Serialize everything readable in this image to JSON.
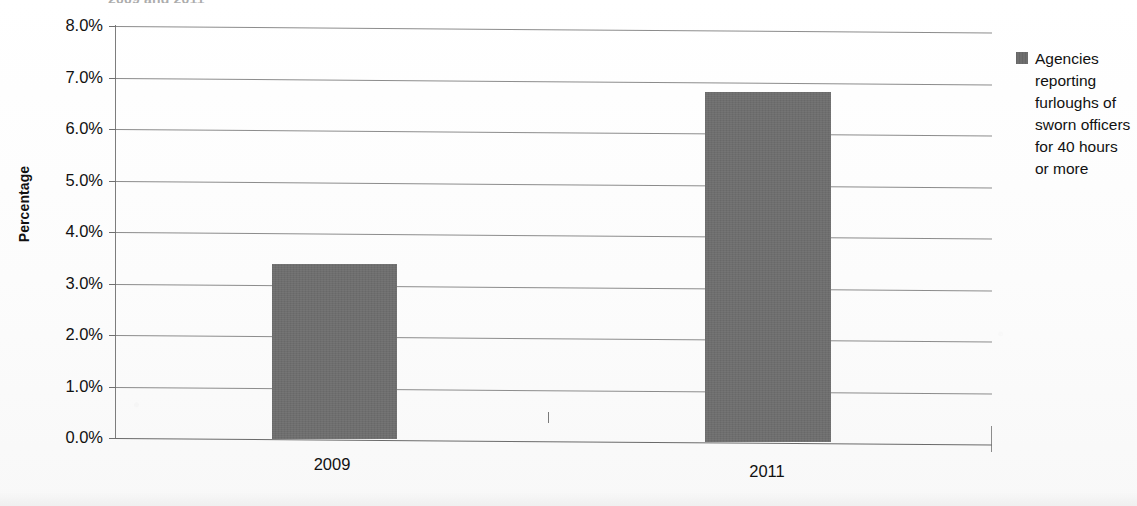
{
  "chart_data": {
    "type": "bar",
    "title": "2009 and 2011",
    "title_visible_note": "cropped at top edge",
    "xlabel": "",
    "ylabel": "Percentage",
    "categories": [
      "2009",
      "2011"
    ],
    "values": [
      3.4,
      6.8
    ],
    "value_labels": [
      "3.4%",
      "6.8%"
    ],
    "ylim": [
      0.0,
      8.0
    ],
    "ytick_step": 1.0,
    "ytick_labels": [
      "0.0%",
      "1.0%",
      "2.0%",
      "3.0%",
      "4.0%",
      "5.0%",
      "6.0%",
      "7.0%",
      "8.0%"
    ],
    "ytick_values": [
      0.0,
      1.0,
      2.0,
      3.0,
      4.0,
      5.0,
      6.0,
      7.0,
      8.0
    ],
    "grid": true,
    "legend_position": "right",
    "series": [
      {
        "name": "Agencies reporting furloughs of sworn officers for 40 hours or more",
        "values": [
          3.4,
          6.8
        ],
        "color": "#6e6e6e"
      }
    ],
    "colors": {
      "bar_fill": "#6e6e6e",
      "gridline": "#8c8c8c",
      "axis": "#7d7d7d",
      "text": "#111111",
      "background": "#fdfdfd"
    }
  },
  "legend": {
    "label": "Agencies reporting furloughs of sworn officers for 40 hours or more",
    "swatch_color": "#6e6e6e"
  },
  "axes": {
    "y_title": "Percentage"
  }
}
